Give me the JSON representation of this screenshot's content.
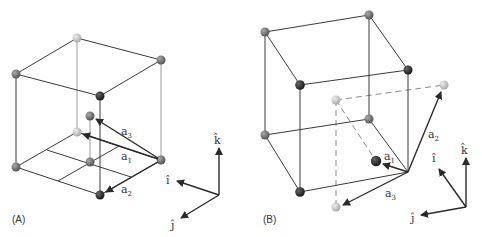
{
  "figure": {
    "panels": [
      {
        "id": "A",
        "label": "(A)",
        "vectors": [
          {
            "name": "a1",
            "base": "a",
            "sub": "1"
          },
          {
            "name": "a2",
            "base": "a",
            "sub": "2"
          },
          {
            "name": "a3",
            "base": "a",
            "sub": "3"
          }
        ],
        "axes": {
          "i": "î",
          "j": "ĵ",
          "k": "k̂"
        }
      },
      {
        "id": "B",
        "label": "(B)",
        "vectors": [
          {
            "name": "a1",
            "base": "a",
            "sub": "1"
          },
          {
            "name": "a2",
            "base": "a",
            "sub": "2"
          },
          {
            "name": "a3",
            "base": "a",
            "sub": "3"
          }
        ],
        "axes": {
          "i": "î",
          "j": "ĵ",
          "k": "k̂"
        }
      }
    ],
    "colors": {
      "dark_atom": "#2b2b2b",
      "mid_atom": "#6e6e6e",
      "light_atom": "#bdbdbd",
      "edge": "#3a3a3a"
    }
  }
}
